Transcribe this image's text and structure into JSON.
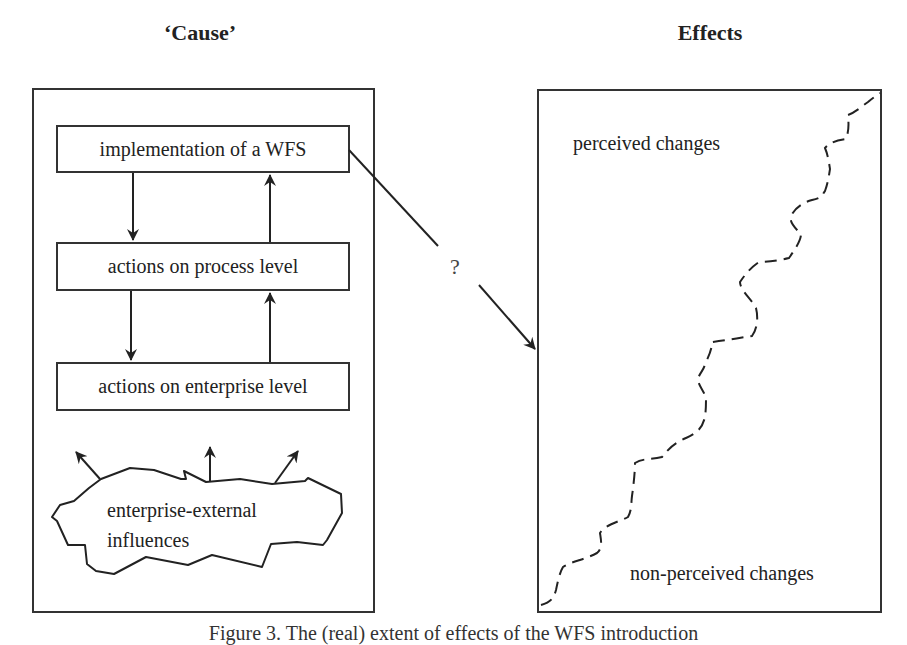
{
  "headings": {
    "cause": "‘Cause’",
    "effects": "Effects"
  },
  "cause_panel": {
    "nodes": [
      {
        "id": "wfs",
        "label": "implementation of a WFS"
      },
      {
        "id": "process",
        "label": "actions on process level"
      },
      {
        "id": "enterprise",
        "label": "actions on enterprise level"
      }
    ],
    "cloud": {
      "line1": "enterprise-external",
      "line2": "influences"
    },
    "edges": [
      {
        "from": "wfs",
        "to": "process",
        "direction": "down"
      },
      {
        "from": "process",
        "to": "wfs",
        "direction": "up"
      },
      {
        "from": "process",
        "to": "enterprise",
        "direction": "down"
      },
      {
        "from": "enterprise",
        "to": "process",
        "direction": "up"
      },
      {
        "from": "cloud",
        "to": "outside",
        "direction": "up-left"
      },
      {
        "from": "cloud",
        "to": "outside",
        "direction": "up"
      },
      {
        "from": "cloud",
        "to": "outside",
        "direction": "up-right"
      }
    ]
  },
  "link": {
    "from": "implementation of a WFS",
    "to": "effects panel",
    "label": "?"
  },
  "effects_panel": {
    "upper_label": "perceived changes",
    "lower_label": "non-perceived changes",
    "divider_style": "dashed wavy diagonal"
  },
  "caption": "Figure 3. The (real) extent of effects of the WFS introduction",
  "colors": {
    "stroke": "#333333",
    "text": "#222222",
    "background": "#ffffff"
  }
}
